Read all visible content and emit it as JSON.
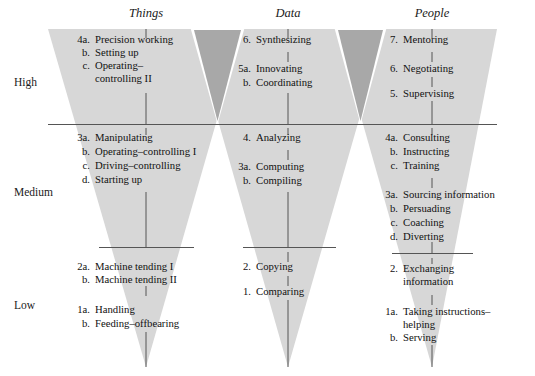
{
  "figure": {
    "type": "diagram",
    "style": "three inverted triangles (funnels) of skill complexity",
    "colors": {
      "triangle_light": "#d7d7d7",
      "triangle_dark": "#a8a8a8",
      "line": "#555555",
      "text": "#111111",
      "background": "#ffffff"
    }
  },
  "columns": [
    {
      "id": "things",
      "header": "Things"
    },
    {
      "id": "data",
      "header": "Data"
    },
    {
      "id": "people",
      "header": "People"
    }
  ],
  "levels": [
    {
      "id": "high",
      "label": "High"
    },
    {
      "id": "medium",
      "label": "Medium"
    },
    {
      "id": "low",
      "label": "Low"
    }
  ],
  "things": {
    "high": [
      {
        "num": "4a.",
        "label": "Precision working"
      },
      {
        "num": "b.",
        "label": "Setting up"
      },
      {
        "num": "c.",
        "label": "Operating–",
        "label2": "controlling II"
      }
    ],
    "medium": [
      {
        "num": "3a.",
        "label": "Manipulating"
      },
      {
        "num": "b.",
        "label": "Operating–controlling I"
      },
      {
        "num": "c.",
        "label": "Driving–controlling"
      },
      {
        "num": "d.",
        "label": "Starting up"
      }
    ],
    "low": [
      {
        "num": "2a.",
        "label": "Machine tending I"
      },
      {
        "num": "b.",
        "label": "Machine tending II"
      },
      {
        "num": "1a.",
        "label": "Handling"
      },
      {
        "num": "b.",
        "label": "Feeding–offbearing"
      }
    ]
  },
  "data": {
    "high": [
      {
        "num": "6.",
        "label": "Synthesizing"
      },
      {
        "num": "5a.",
        "label": "Innovating"
      },
      {
        "num": "b.",
        "label": "Coordinating"
      }
    ],
    "medium": [
      {
        "num": "4.",
        "label": "Analyzing"
      },
      {
        "num": "3a.",
        "label": "Computing"
      },
      {
        "num": "b.",
        "label": "Compiling"
      }
    ],
    "low": [
      {
        "num": "2.",
        "label": "Copying"
      },
      {
        "num": "1.",
        "label": "Comparing"
      }
    ]
  },
  "people": {
    "high": [
      {
        "num": "7.",
        "label": "Mentoring"
      },
      {
        "num": "6.",
        "label": "Negotiating"
      },
      {
        "num": "5.",
        "label": "Supervising"
      }
    ],
    "medium": [
      {
        "num": "4a.",
        "label": "Consulting"
      },
      {
        "num": "b.",
        "label": "Instructing"
      },
      {
        "num": "c.",
        "label": "Training"
      },
      {
        "num": "3a.",
        "label": "Sourcing information"
      },
      {
        "num": "b.",
        "label": "Persuading"
      },
      {
        "num": "c.",
        "label": "Coaching"
      },
      {
        "num": "d.",
        "label": "Diverting"
      }
    ],
    "low": [
      {
        "num": "2.",
        "label": "Exchanging",
        "label2": "information"
      },
      {
        "num": "1a.",
        "label": "Taking instructions–",
        "label2": "helping"
      },
      {
        "num": "b.",
        "label": "Serving"
      }
    ]
  }
}
